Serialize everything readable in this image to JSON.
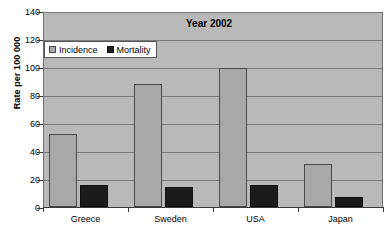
{
  "chart_data": {
    "type": "bar",
    "title": "Year 2002",
    "xlabel": "",
    "ylabel": "Rate per 100 000",
    "categories": [
      "Greece",
      "Sweden",
      "USA",
      "Japan"
    ],
    "series": [
      {
        "name": "Incidence",
        "color": "#a8a8a8",
        "values": [
          52,
          88,
          99,
          31
        ]
      },
      {
        "name": "Mortality",
        "color": "#1b1b1b",
        "values": [
          16,
          14,
          16,
          7
        ]
      }
    ],
    "ylim": [
      0,
      140
    ],
    "yticks": [
      0,
      20,
      40,
      60,
      80,
      100,
      120,
      140
    ],
    "ytick_labels": [
      "0",
      "20",
      "40",
      "60",
      "80",
      "100",
      "120",
      "140"
    ],
    "grid": true,
    "legend_position": "upper-left-inside",
    "plot_background": "#b9b9b9"
  }
}
